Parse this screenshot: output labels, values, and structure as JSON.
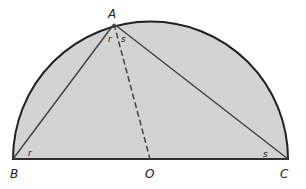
{
  "diagram": {
    "points": {
      "A": "A",
      "B": "B",
      "C": "C",
      "O": "O"
    },
    "angle_labels": {
      "angle_A_left": "r",
      "angle_A_right": "s",
      "angle_B": "r",
      "angle_C": "s"
    },
    "colors": {
      "fill": "#d3d3d3",
      "stroke": "#333333"
    }
  }
}
